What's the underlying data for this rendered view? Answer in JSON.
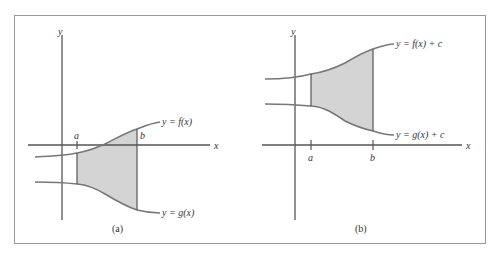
{
  "figure": {
    "panels": [
      {
        "caption": "(a)",
        "axis_x_label": "x",
        "axis_y_label": "y",
        "tick_a": "a",
        "tick_b": "b",
        "upper_curve_label": "y = f(x)",
        "lower_curve_label": "y = g(x)"
      },
      {
        "caption": "(b)",
        "axis_x_label": "x",
        "axis_y_label": "y",
        "tick_a": "a",
        "tick_b": "b",
        "upper_curve_label": "y = f(x) + c",
        "lower_curve_label": "y = g(x) + c"
      }
    ],
    "colors": {
      "shade": "#d4d4d4",
      "axis": "#555555",
      "curve": "#777777",
      "frame": "#999999"
    }
  }
}
